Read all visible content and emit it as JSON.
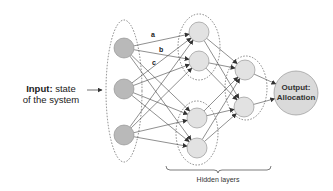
{
  "input_label": {
    "bold": "Input:",
    "rest": " state",
    "line2": "of the system"
  },
  "output_label": {
    "line1": "Output:",
    "line2": "Allocation"
  },
  "hidden_label": "Hidden layers",
  "edge_labels": {
    "a": "a",
    "b": "b",
    "c": "c"
  },
  "colors": {
    "input_node": "#b9b9b9",
    "hidden_node": "#e2e2e2",
    "output_node": "#dadada",
    "edge": "#444444",
    "dashed": "#555555"
  },
  "layers": {
    "input": [
      [
        124,
        48
      ],
      [
        124,
        89
      ],
      [
        124,
        135
      ]
    ],
    "hidden1": [
      [
        199,
        32
      ],
      [
        199,
        61
      ],
      [
        197,
        118
      ],
      [
        197,
        148
      ]
    ],
    "hidden2": [
      [
        245,
        70
      ],
      [
        244,
        107
      ]
    ],
    "output": [
      [
        296,
        93
      ]
    ]
  }
}
